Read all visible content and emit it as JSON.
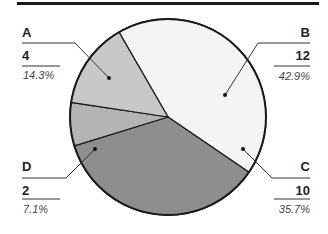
{
  "chart_data": {
    "type": "pie",
    "title": "",
    "categories": [
      "A",
      "B",
      "C",
      "D"
    ],
    "values": [
      4,
      12,
      10,
      2
    ],
    "percentages": [
      "14.3%",
      "42.9%",
      "35.7%",
      "7.1%"
    ],
    "colors": {
      "A": "#c8c8c8",
      "B": "#f4f4f4",
      "C": "#8e8e8e",
      "D": "#b4b4b4"
    },
    "start_angle_deg": -120,
    "direction": "clockwise",
    "slice_order": [
      "B",
      "C",
      "D",
      "A"
    ],
    "legend": "none",
    "annotations": [
      {
        "name": "A",
        "value": "4",
        "percent": "14.3%",
        "side": "left-top"
      },
      {
        "name": "B",
        "value": "12",
        "percent": "42.9%",
        "side": "right-top"
      },
      {
        "name": "C",
        "value": "10",
        "percent": "35.7%",
        "side": "right-bottom"
      },
      {
        "name": "D",
        "value": "2",
        "percent": "7.1%",
        "side": "left-bottom"
      }
    ]
  },
  "labels": {
    "A": {
      "name": "A",
      "value": "4",
      "percent": "14.3%"
    },
    "B": {
      "name": "B",
      "value": "12",
      "percent": "42.9%"
    },
    "C": {
      "name": "C",
      "value": "10",
      "percent": "35.7%"
    },
    "D": {
      "name": "D",
      "value": "2",
      "percent": "7.1%"
    }
  }
}
